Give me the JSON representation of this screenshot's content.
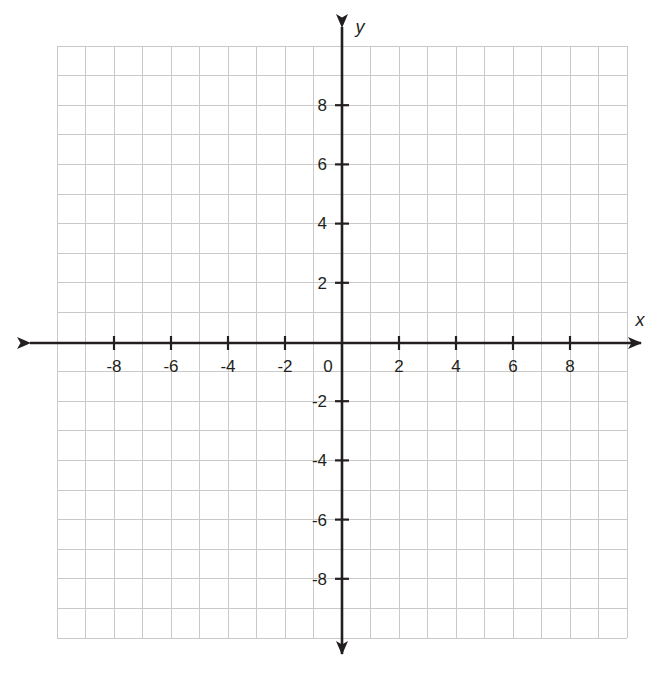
{
  "figure": {
    "kind": "cartesian-coordinate-plane",
    "title": "",
    "background_color": "#ffffff",
    "grid_color": "#c9c9c9",
    "grid_minor_color": "#d8d8d8",
    "axis_color": "#231f20",
    "label_color": "#231f20"
  },
  "chart_data": {
    "type": "scatter",
    "title": "",
    "subtitle": "",
    "xlabel": "x",
    "ylabel": "y",
    "xlim": [
      -10,
      10
    ],
    "ylim": [
      -10,
      10
    ],
    "grid": true,
    "grid_step": 1,
    "legend": "none",
    "series": [],
    "x": [],
    "y": [],
    "annotations": [],
    "x_tick_labels": [
      "-8",
      "-6",
      "-4",
      "-2",
      "0",
      "2",
      "4",
      "6",
      "8"
    ],
    "x_tick_values": [
      -8,
      -6,
      -4,
      -2,
      0,
      2,
      4,
      6,
      8
    ],
    "y_tick_labels": [
      "8",
      "6",
      "4",
      "2",
      "-2",
      "-4",
      "-6",
      "-8"
    ],
    "y_tick_values": [
      8,
      6,
      4,
      2,
      -2,
      -4,
      -6,
      -8
    ],
    "tick_step": 2,
    "origin_label": "0"
  },
  "axes": {
    "x_axis_name": "x",
    "y_axis_name": "y",
    "origin_label": "0",
    "x_ticks": [
      {
        "value": -8,
        "label": "-8"
      },
      {
        "value": -6,
        "label": "-6"
      },
      {
        "value": -4,
        "label": "-4"
      },
      {
        "value": -2,
        "label": "-2"
      },
      {
        "value": 2,
        "label": "2"
      },
      {
        "value": 4,
        "label": "4"
      },
      {
        "value": 6,
        "label": "6"
      },
      {
        "value": 8,
        "label": "8"
      }
    ],
    "y_ticks": [
      {
        "value": 8,
        "label": "8"
      },
      {
        "value": 6,
        "label": "6"
      },
      {
        "value": 4,
        "label": "4"
      },
      {
        "value": 2,
        "label": "2"
      },
      {
        "value": -2,
        "label": "-2"
      },
      {
        "value": -4,
        "label": "-4"
      },
      {
        "value": -6,
        "label": "-6"
      },
      {
        "value": -8,
        "label": "-8"
      }
    ]
  }
}
